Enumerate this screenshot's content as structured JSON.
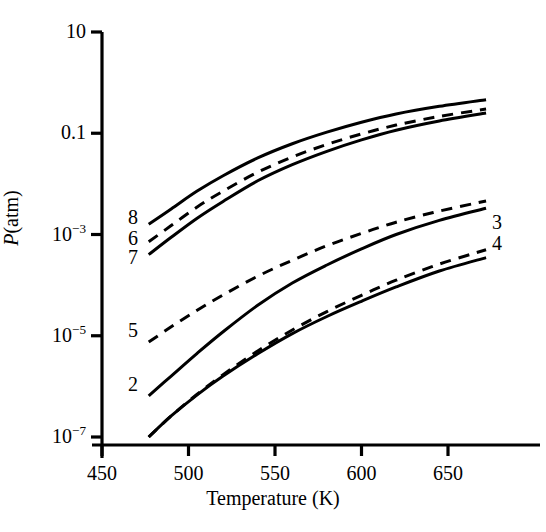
{
  "chart_data": {
    "type": "line",
    "title": "",
    "xlabel": "Temperature (K)",
    "ylabel": "P(atm)",
    "xlim": [
      450,
      672
    ],
    "ylim": [
      1e-07,
      10
    ],
    "yscale": "log",
    "xscale": "linear",
    "grid": false,
    "legend": "inline-curve-labels",
    "xticks": [
      450,
      500,
      550,
      600,
      650
    ],
    "xticklabels": [
      "450",
      "500",
      "550",
      "600",
      "650"
    ],
    "yticks": [
      10,
      0.1,
      0.001,
      1e-05,
      1e-07
    ],
    "yticklabels": [
      "10",
      "0.1",
      "10-3",
      "10-5",
      "10-7"
    ],
    "series": [
      {
        "name": "8",
        "label": "8",
        "style": "solid",
        "label_position": "left",
        "x": [
          477,
          490,
          505,
          520,
          540,
          560,
          580,
          600,
          620,
          645,
          672
        ],
        "y": [
          0.0016,
          0.0032,
          0.0072,
          0.0145,
          0.0325,
          0.062,
          0.105,
          0.165,
          0.24,
          0.34,
          0.46
        ]
      },
      {
        "name": "6",
        "label": "6",
        "style": "dashed",
        "label_position": "left",
        "x": [
          477,
          490,
          505,
          520,
          540,
          560,
          580,
          600,
          620,
          645,
          672
        ],
        "y": [
          0.00072,
          0.0015,
          0.0035,
          0.0072,
          0.017,
          0.034,
          0.06,
          0.097,
          0.145,
          0.215,
          0.3
        ]
      },
      {
        "name": "7",
        "label": "7",
        "style": "solid",
        "label_position": "left",
        "x": [
          477,
          490,
          505,
          520,
          540,
          560,
          580,
          600,
          620,
          645,
          672
        ],
        "y": [
          0.0004,
          0.00088,
          0.0021,
          0.0045,
          0.0115,
          0.024,
          0.044,
          0.074,
          0.115,
          0.175,
          0.25
        ]
      },
      {
        "name": "5",
        "label": "5",
        "style": "dashed",
        "label_position": "left",
        "x": [
          477,
          490,
          505,
          520,
          540,
          560,
          580,
          600,
          620,
          645,
          672
        ],
        "y": [
          7.5e-06,
          1.5e-05,
          3.2e-05,
          6.4e-05,
          0.00015,
          0.00031,
          0.0006,
          0.00105,
          0.00175,
          0.0029,
          0.0046
        ]
      },
      {
        "name": "2",
        "label": "2",
        "style": "solid",
        "label_position": "left",
        "x": [
          477,
          490,
          505,
          520,
          540,
          560,
          580,
          600,
          620,
          645,
          672
        ],
        "y": [
          6.5e-07,
          1.6e-06,
          4.5e-06,
          1.2e-05,
          4e-05,
          0.00011,
          0.00025,
          0.00052,
          0.001,
          0.0019,
          0.0033
        ]
      },
      {
        "name": "3",
        "label": "3",
        "style": "dashed",
        "label_position": "right",
        "x": [
          477,
          490,
          505,
          520,
          540,
          560,
          580,
          600,
          620,
          645,
          672
        ],
        "y": [
          1e-07,
          2.6e-07,
          7e-07,
          1.7e-06,
          5e-06,
          1.3e-05,
          3e-05,
          6.3e-05,
          0.000125,
          0.00026,
          0.0005
        ]
      },
      {
        "name": "4",
        "label": "4",
        "style": "solid",
        "label_position": "right",
        "x": [
          477,
          490,
          505,
          520,
          540,
          560,
          580,
          600,
          620,
          645,
          672
        ],
        "y": [
          1e-07,
          2.6e-07,
          6.8e-07,
          1.6e-06,
          4.4e-06,
          1.1e-05,
          2.4e-05,
          4.8e-05,
          9.2e-05,
          0.00019,
          0.00035
        ]
      }
    ]
  },
  "axes": {
    "y_title_italic": "P",
    "y_title_rest": "(atm)",
    "x_title": "Temperature (K)",
    "ytick_labels": [
      {
        "mantissa": "10",
        "exponent": ""
      },
      {
        "mantissa": "0.1",
        "exponent": ""
      },
      {
        "mantissa": "10",
        "exponent": "−3"
      },
      {
        "mantissa": "10",
        "exponent": "−5"
      },
      {
        "mantissa": "10",
        "exponent": "−7"
      }
    ],
    "xtick_labels": [
      "450",
      "500",
      "550",
      "600",
      "650"
    ]
  },
  "curve_labels": [
    {
      "text": "8",
      "left": 128,
      "top": 207
    },
    {
      "text": "6",
      "left": 128,
      "top": 228
    },
    {
      "text": "7",
      "left": 128,
      "top": 247
    },
    {
      "text": "5",
      "left": 128,
      "top": 320
    },
    {
      "text": "2",
      "left": 128,
      "top": 374
    },
    {
      "text": "3",
      "left": 492,
      "top": 212
    },
    {
      "text": "4",
      "left": 492,
      "top": 233
    }
  ],
  "colors": {
    "ink": "#000000",
    "background": "#ffffff"
  }
}
